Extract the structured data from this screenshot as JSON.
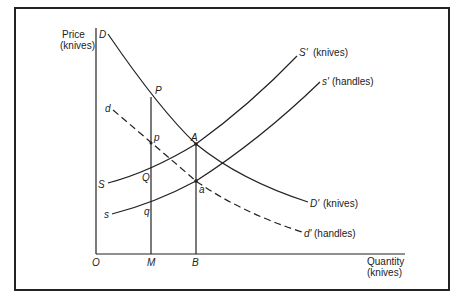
{
  "diagram": {
    "axes": {
      "y_label_line1": "Price",
      "y_label_line2": "(knives)",
      "x_label_line1": "Quantity",
      "x_label_line2": "(knives)",
      "origin": "O"
    },
    "x_ticks": [
      {
        "label": "M"
      },
      {
        "label": "B"
      }
    ],
    "curves": {
      "D_start": "D",
      "D_end": "D'",
      "D_end_note": "(knives)",
      "d_start": "d",
      "d_end": "d'",
      "d_end_note": "(handles)",
      "S_start": "S",
      "S_end": "S'",
      "S_end_note": "(knives)",
      "s_start": "s",
      "s_end": "s'",
      "s_end_note": "(handles)"
    },
    "points": {
      "P": "P",
      "p": "p",
      "A": "A",
      "a": "a",
      "Q": "Q",
      "q": "q"
    },
    "colors": {
      "line": "#222222",
      "background": "#ffffff"
    }
  }
}
